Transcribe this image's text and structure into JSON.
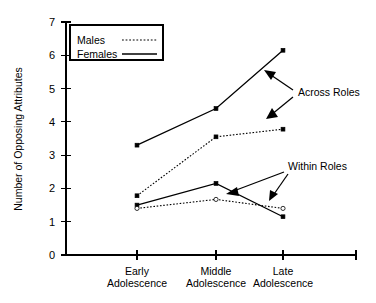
{
  "chart_data": {
    "type": "line",
    "title": "",
    "xlabel": "",
    "ylabel": "Number of Opposing Attributes",
    "categories": [
      "Early Adolescence",
      "Middle Adolescence",
      "Late Adolescence"
    ],
    "category_lines": [
      [
        "Early",
        "Adolescence"
      ],
      [
        "Middle",
        "Adolescence"
      ],
      [
        "Late",
        "Adolescence"
      ]
    ],
    "ylim": [
      0,
      7
    ],
    "yticks": [
      0,
      1,
      2,
      3,
      4,
      5,
      6,
      7
    ],
    "ytick_labels": [
      "0",
      "1",
      "2",
      "3",
      "4",
      "5",
      "6",
      "7"
    ],
    "grid": false,
    "legend_position": "top-left",
    "series": [
      {
        "name": "Females Across Roles",
        "gender": "Females",
        "group": "Across Roles",
        "style": "solid",
        "marker": "filled-square",
        "values": [
          3.3,
          4.4,
          6.15
        ]
      },
      {
        "name": "Males Across Roles",
        "gender": "Males",
        "group": "Across Roles",
        "style": "dotted",
        "marker": "filled-square",
        "values": [
          1.78,
          3.55,
          3.78
        ]
      },
      {
        "name": "Females Within Roles",
        "gender": "Females",
        "group": "Within Roles",
        "style": "solid",
        "marker": "filled-square",
        "values": [
          1.5,
          2.15,
          1.15
        ]
      },
      {
        "name": "Males Within Roles",
        "gender": "Males",
        "group": "Within Roles",
        "style": "dotted",
        "marker": "open-circle",
        "values": [
          1.4,
          1.67,
          1.4
        ]
      }
    ],
    "annotations": [
      {
        "text": "Across Roles",
        "targets": [
          "Females Across Roles",
          "Males Across Roles"
        ]
      },
      {
        "text": "Within Roles",
        "targets": [
          "Females Within Roles",
          "Males Within Roles"
        ]
      }
    ],
    "legend": {
      "entries": [
        {
          "label": "Males",
          "style": "dotted"
        },
        {
          "label": "Females",
          "style": "solid"
        }
      ]
    },
    "colors": {
      "line": "#000000",
      "axis": "#000000",
      "background": "#ffffff"
    }
  }
}
